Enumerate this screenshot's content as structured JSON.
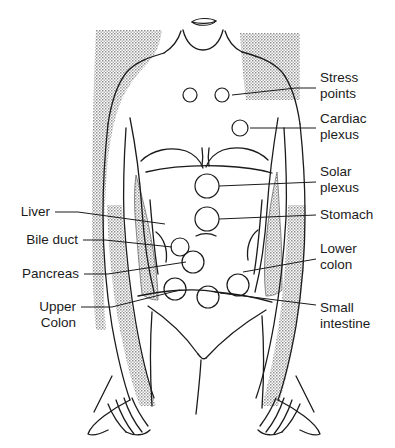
{
  "figure": {
    "background_color": "#ffffff",
    "line_color": "#1b1b1b",
    "shade_color": "#8a8a8a"
  },
  "labels": {
    "left": [
      {
        "id": "liver",
        "line1": "Liver",
        "line2": "",
        "text_x": 50,
        "text_y": 216,
        "anchor": "end",
        "leader": [
          [
            55,
            212
          ],
          [
            78,
            212
          ],
          [
            165,
            224
          ]
        ]
      },
      {
        "id": "bile-duct",
        "line1": "Bile duct",
        "line2": "",
        "text_x": 78,
        "text_y": 244,
        "anchor": "end",
        "leader": [
          [
            83,
            240
          ],
          [
            105,
            240
          ],
          [
            172,
            247
          ]
        ]
      },
      {
        "id": "pancreas",
        "line1": "Pancreas",
        "line2": "",
        "text_x": 79,
        "text_y": 278,
        "anchor": "end",
        "leader": [
          [
            84,
            274
          ],
          [
            108,
            274
          ],
          [
            186,
            262
          ]
        ]
      },
      {
        "id": "upper-colon",
        "line1": "Upper",
        "line2": "Colon",
        "text_x": 76,
        "text_y": 311,
        "anchor": "end",
        "leader": [
          [
            81,
            307
          ],
          [
            112,
            307
          ],
          [
            180,
            290
          ]
        ]
      }
    ],
    "right": [
      {
        "id": "stress-points",
        "line1": "Stress",
        "line2": "points",
        "text_x": 320,
        "text_y": 82,
        "anchor": "start",
        "leader": [
          [
            316,
            88
          ],
          [
            296,
            88
          ],
          [
            232,
            95
          ]
        ]
      },
      {
        "id": "cardiac-plexus",
        "line1": "Cardiac",
        "line2": "plexus",
        "text_x": 320,
        "text_y": 123,
        "anchor": "start",
        "leader": [
          [
            316,
            128
          ],
          [
            250,
            128
          ]
        ]
      },
      {
        "id": "solar-plexus",
        "line1": "Solar",
        "line2": "plexus",
        "text_x": 320,
        "text_y": 176,
        "anchor": "start",
        "leader": [
          [
            316,
            182
          ],
          [
            219,
            186
          ]
        ]
      },
      {
        "id": "stomach",
        "line1": "Stomach",
        "line2": "",
        "text_x": 320,
        "text_y": 219,
        "anchor": "start",
        "leader": [
          [
            316,
            215
          ],
          [
            219,
            219
          ]
        ]
      },
      {
        "id": "lower-colon",
        "line1": "Lower",
        "line2": "colon",
        "text_x": 320,
        "text_y": 253,
        "anchor": "start",
        "leader": [
          [
            316,
            259
          ],
          [
            243,
            272
          ]
        ]
      },
      {
        "id": "small-intestine",
        "line1": "Small",
        "line2": "intestine",
        "text_x": 320,
        "text_y": 312,
        "anchor": "start",
        "leader": [
          [
            316,
            305
          ],
          [
            220,
            293
          ]
        ]
      }
    ]
  },
  "points": [
    {
      "id": "stress-point-left",
      "cx": 190,
      "cy": 95,
      "r": 7
    },
    {
      "id": "stress-point-right",
      "cx": 222,
      "cy": 95,
      "r": 7
    },
    {
      "id": "cardiac-plexus-point",
      "cx": 240,
      "cy": 128,
      "r": 8
    },
    {
      "id": "solar-plexus-point",
      "cx": 207,
      "cy": 186,
      "r": 12
    },
    {
      "id": "stomach-point",
      "cx": 207,
      "cy": 219,
      "r": 12
    },
    {
      "id": "bile-duct-point",
      "cx": 180,
      "cy": 247,
      "r": 9
    },
    {
      "id": "pancreas-point",
      "cx": 193,
      "cy": 262,
      "r": 11
    },
    {
      "id": "upper-colon-point",
      "cx": 175,
      "cy": 289,
      "r": 11
    },
    {
      "id": "small-intestine-point",
      "cx": 208,
      "cy": 297,
      "r": 11
    },
    {
      "id": "lower-colon-point",
      "cx": 238,
      "cy": 285,
      "r": 11
    }
  ],
  "shading": {
    "shoulder_left": "stippled-gray",
    "shoulder_right": "stippled-gray",
    "liver_band": "stippled-gray",
    "arm_band_left": "stippled-gray",
    "arm_band_right": "stippled-gray"
  }
}
